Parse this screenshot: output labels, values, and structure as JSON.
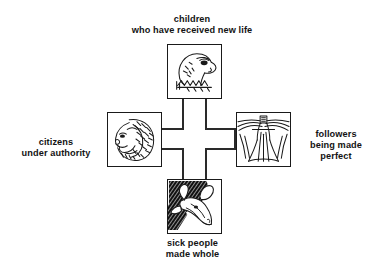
{
  "diagram": {
    "type": "cross-diagram",
    "title": "",
    "background_color": "#ffffff",
    "line_color": "#1a1a1a",
    "text_color": "#131313",
    "center_symbol": "cross",
    "nodes": [
      {
        "position": "top",
        "icon": "eagle-head-icon",
        "label": "children\nwho have received new life"
      },
      {
        "position": "left",
        "icon": "lion-head-icon",
        "label": "citizens\nunder authority"
      },
      {
        "position": "right",
        "icon": "winged-man-icon",
        "label": "followers\nbeing made\nperfect"
      },
      {
        "position": "bottom",
        "icon": "ox-head-icon",
        "label": "sick people\nmade whole"
      }
    ]
  }
}
